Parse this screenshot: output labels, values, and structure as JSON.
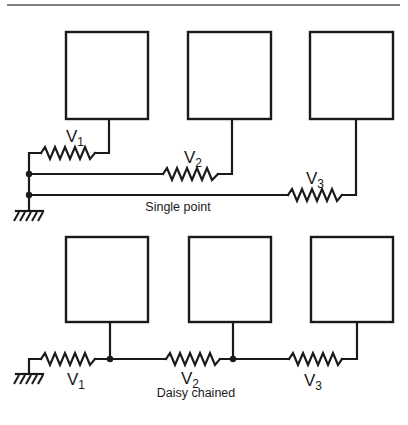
{
  "figure": {
    "colors": {
      "ink": "#1a1a1a",
      "rule": "#555555",
      "background": "#ffffff"
    },
    "top_rule": {
      "x1": 7,
      "x2": 400,
      "y": 5
    },
    "panels": [
      {
        "id": "single-point",
        "caption": "Single point",
        "caption_pos": {
          "x": 178,
          "y": 211
        },
        "boxes": [
          {
            "x": 66,
            "y": 32,
            "w": 82,
            "h": 87
          },
          {
            "x": 188,
            "y": 32,
            "w": 83,
            "h": 87
          },
          {
            "x": 310,
            "y": 32,
            "w": 83,
            "h": 87
          }
        ],
        "resistors": [
          {
            "label": "V",
            "sub": "1",
            "x1": 41,
            "x2": 95,
            "y": 153,
            "label_x": 66,
            "label_y": 142
          },
          {
            "label": "V",
            "sub": "2",
            "x1": 163,
            "x2": 218,
            "y": 174,
            "label_x": 184,
            "label_y": 163
          },
          {
            "label": "V",
            "sub": "3",
            "x1": 288,
            "x2": 342,
            "y": 195,
            "label_x": 306,
            "label_y": 184
          }
        ],
        "ground": {
          "x": 29,
          "y": 211
        }
      },
      {
        "id": "daisy-chained",
        "caption": "Daisy chained",
        "caption_pos": {
          "x": 196,
          "y": 397
        },
        "boxes": [
          {
            "x": 66,
            "y": 237,
            "w": 82,
            "h": 85
          },
          {
            "x": 189,
            "y": 237,
            "w": 82,
            "h": 85
          },
          {
            "x": 311,
            "y": 237,
            "w": 82,
            "h": 85
          }
        ],
        "resistors": [
          {
            "label": "V",
            "sub": "1",
            "x1": 41,
            "x2": 95,
            "y": 359,
            "label_x": 67,
            "label_y": 385
          },
          {
            "label": "V",
            "sub": "2",
            "x1": 166,
            "x2": 220,
            "y": 359,
            "label_x": 181,
            "label_y": 384
          },
          {
            "label": "V",
            "sub": "3",
            "x1": 289,
            "x2": 342,
            "y": 359,
            "label_x": 304,
            "label_y": 386
          }
        ],
        "ground": {
          "x": 29,
          "y": 374
        }
      }
    ]
  }
}
